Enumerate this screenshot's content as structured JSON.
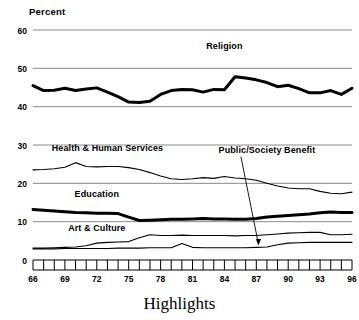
{
  "chart_data": {
    "type": "line",
    "title": "Highlights",
    "ylabel": "Percent",
    "xlabel": "",
    "ylim": [
      0,
      60
    ],
    "yticks": [
      0,
      10,
      20,
      30,
      40,
      50,
      60
    ],
    "xlim": [
      66,
      96
    ],
    "xticks": [
      66,
      69,
      72,
      75,
      78,
      81,
      84,
      87,
      90,
      93,
      96
    ],
    "xtick_labels": [
      "66",
      "69",
      "72",
      "75",
      "78",
      "81",
      "84",
      "87",
      "90",
      "93",
      "96"
    ],
    "xtick_minor_every": 1,
    "grid": "horizontal",
    "legend": "inline-labels",
    "x": [
      66,
      67,
      68,
      69,
      70,
      71,
      72,
      73,
      74,
      75,
      76,
      77,
      78,
      79,
      80,
      81,
      82,
      83,
      84,
      85,
      86,
      87,
      88,
      89,
      90,
      91,
      92,
      93,
      94,
      95,
      96
    ],
    "series": [
      {
        "name": "Religion",
        "label": "Religion",
        "style": "thick",
        "label_x": 84,
        "label_y": 55,
        "values": [
          45.5,
          44.2,
          44.3,
          44.8,
          44.2,
          44.6,
          44.9,
          43.8,
          42.6,
          41.2,
          41.1,
          41.4,
          43.2,
          44.2,
          44.5,
          44.4,
          43.8,
          44.5,
          44.4,
          47.8,
          47.5,
          47.0,
          46.3,
          45.2,
          45.6,
          44.7,
          43.6,
          43.6,
          44.2,
          43.2,
          44.8
        ]
      },
      {
        "name": "Health & Human Services",
        "label": "Health & Human Services",
        "style": "thin",
        "label_x": 73,
        "label_y": 28.5,
        "values": [
          23.5,
          23.6,
          23.8,
          24.2,
          25.4,
          24.4,
          24.3,
          24.4,
          24.4,
          24.1,
          23.6,
          22.8,
          21.9,
          21.2,
          21.0,
          21.2,
          21.5,
          21.3,
          21.8,
          21.4,
          21.2,
          20.8,
          20.0,
          19.3,
          18.8,
          18.6,
          18.6,
          17.9,
          17.4,
          17.3,
          17.7
        ]
      },
      {
        "name": "Education",
        "label": "Education",
        "style": "thick",
        "label_x": 72,
        "label_y": 16.5,
        "values": [
          13.2,
          13.0,
          12.8,
          12.6,
          12.4,
          12.3,
          12.2,
          12.2,
          12.1,
          11.2,
          10.3,
          10.4,
          10.5,
          10.6,
          10.6,
          10.7,
          10.8,
          10.7,
          10.7,
          10.6,
          10.6,
          10.8,
          11.2,
          11.4,
          11.6,
          11.8,
          12.0,
          12.3,
          12.5,
          12.4,
          12.4
        ]
      },
      {
        "name": "Art & Culture",
        "label": "Art & Culture",
        "style": "thin",
        "label_x": 72,
        "label_y": 7.6,
        "values": [
          3.1,
          3.1,
          3.2,
          3.3,
          3.4,
          3.7,
          4.4,
          4.6,
          4.7,
          4.8,
          5.8,
          6.6,
          6.4,
          6.4,
          6.5,
          6.4,
          6.4,
          6.4,
          6.4,
          6.3,
          6.4,
          6.4,
          6.6,
          6.8,
          7.0,
          7.1,
          7.2,
          7.2,
          6.6,
          6.6,
          6.7
        ]
      },
      {
        "name": "Public/Society Benefit",
        "label": "Public/Society Benefit",
        "style": "thin",
        "annotation": true,
        "label_x": 88,
        "label_y": 28.0,
        "arrow_to_x": 87.2,
        "arrow_to_y": 3.4,
        "values": [
          2.9,
          2.9,
          2.9,
          3.0,
          3.0,
          3.0,
          3.0,
          3.0,
          3.1,
          3.1,
          3.1,
          3.2,
          3.2,
          3.2,
          4.3,
          3.3,
          3.2,
          3.2,
          3.2,
          3.2,
          3.2,
          3.3,
          3.4,
          4.0,
          4.4,
          4.5,
          4.6,
          4.6,
          4.6,
          4.6,
          4.6
        ]
      }
    ]
  },
  "colors": {
    "line": "#000000",
    "grid": "#8a8a8a",
    "background": "#ffffff",
    "text": "#000000"
  }
}
